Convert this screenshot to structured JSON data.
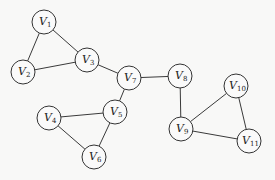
{
  "graph": {
    "type": "undirected",
    "node_radius": 12,
    "nodes": [
      {
        "id": "V1",
        "base": "V",
        "sub": "1",
        "x": 44,
        "y": 22
      },
      {
        "id": "V2",
        "base": "V",
        "sub": "2",
        "x": 23,
        "y": 72
      },
      {
        "id": "V3",
        "base": "V",
        "sub": "3",
        "x": 87,
        "y": 60
      },
      {
        "id": "V4",
        "base": "V",
        "sub": "4",
        "x": 49,
        "y": 118
      },
      {
        "id": "V5",
        "base": "V",
        "sub": "5",
        "x": 115,
        "y": 112
      },
      {
        "id": "V6",
        "base": "V",
        "sub": "6",
        "x": 94,
        "y": 157
      },
      {
        "id": "V7",
        "base": "V",
        "sub": "7",
        "x": 129,
        "y": 78
      },
      {
        "id": "V8",
        "base": "V",
        "sub": "8",
        "x": 180,
        "y": 76
      },
      {
        "id": "V9",
        "base": "V",
        "sub": "9",
        "x": 181,
        "y": 129
      },
      {
        "id": "V10",
        "base": "V",
        "sub": "10",
        "x": 236,
        "y": 86
      },
      {
        "id": "V11",
        "base": "V",
        "sub": "11",
        "x": 249,
        "y": 141
      }
    ],
    "edges": [
      [
        "V1",
        "V2"
      ],
      [
        "V1",
        "V3"
      ],
      [
        "V2",
        "V3"
      ],
      [
        "V3",
        "V7"
      ],
      [
        "V7",
        "V8"
      ],
      [
        "V7",
        "V5"
      ],
      [
        "V4",
        "V5"
      ],
      [
        "V4",
        "V6"
      ],
      [
        "V5",
        "V6"
      ],
      [
        "V8",
        "V9"
      ],
      [
        "V9",
        "V10"
      ],
      [
        "V9",
        "V11"
      ],
      [
        "V10",
        "V11"
      ]
    ]
  }
}
